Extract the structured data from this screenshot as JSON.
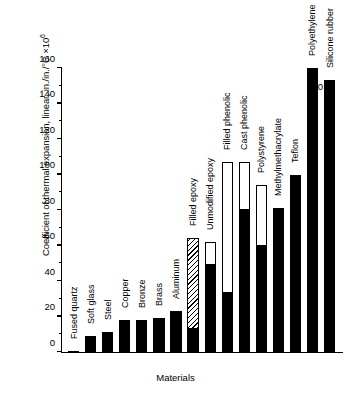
{
  "chart": {
    "type": "bar",
    "ylabel_prefix": "Coefficient of thermal expansion, linear, in./in./°C ×10",
    "ylabel_exponent": "6",
    "xlabel": "Materials"
  },
  "chart_data": {
    "type": "bar",
    "title": "",
    "xlabel": "Materials",
    "ylabel": "Coefficient of thermal expansion, linear, in./in./°C ×10⁶",
    "ylim": [
      0,
      160
    ],
    "yticks": [
      0,
      20,
      40,
      60,
      80,
      100,
      120,
      140,
      160
    ],
    "ytick_labels": [
      "0",
      "20",
      "40",
      "60",
      "80",
      "100",
      "120",
      "140",
      "160"
    ],
    "minor_tick_step": 10,
    "grid": false,
    "legend": null,
    "categories": [
      "Fused quartz",
      "Soft glass",
      "Steel",
      "Copper",
      "Bronze",
      "Brass",
      "Aluminum",
      "Filled epoxy",
      "Unmodified epoxy",
      "Filled phenolic",
      "Cast phenolic",
      "Polystyrene",
      "Methylmethacrylate",
      "Teflon",
      "Polyethylene",
      "Silicone rubber"
    ],
    "bars": [
      {
        "label": "Fused quartz",
        "solid_to": 0.6,
        "range_to": null,
        "style": "solid",
        "annotation": null
      },
      {
        "label": "Soft glass",
        "solid_to": 9,
        "range_to": null,
        "style": "solid",
        "annotation": null
      },
      {
        "label": "Steel",
        "solid_to": 11,
        "range_to": null,
        "style": "solid",
        "annotation": null
      },
      {
        "label": "Copper",
        "solid_to": 18,
        "range_to": null,
        "style": "solid",
        "annotation": null
      },
      {
        "label": "Bronze",
        "solid_to": 18,
        "range_to": null,
        "style": "solid",
        "annotation": null
      },
      {
        "label": "Brass",
        "solid_to": 19,
        "range_to": null,
        "style": "solid",
        "annotation": null
      },
      {
        "label": "Aluminum",
        "solid_to": 23,
        "range_to": null,
        "style": "solid",
        "annotation": null
      },
      {
        "label": "Filled epoxy",
        "solid_to": 13,
        "range_to": 64,
        "style": "hatch",
        "annotation": null
      },
      {
        "label": "Unmodified epoxy",
        "solid_to": 49,
        "range_to": 62,
        "style": "open",
        "annotation": null
      },
      {
        "label": "Filled phenolic",
        "solid_to": 33,
        "range_to": 107,
        "style": "open",
        "annotation": null
      },
      {
        "label": "Cast phenolic",
        "solid_to": 80,
        "range_to": 107,
        "style": "open",
        "annotation": null
      },
      {
        "label": "Polystyrene",
        "solid_to": 60,
        "range_to": 94,
        "style": "open",
        "annotation": null
      },
      {
        "label": "Methylmethacrylate",
        "solid_to": 81,
        "range_to": null,
        "style": "solid",
        "annotation": null
      },
      {
        "label": "Teflon",
        "solid_to": 100,
        "range_to": null,
        "style": "solid",
        "annotation": null
      },
      {
        "label": "Polyethylene",
        "solid_to": 160,
        "range_to": null,
        "style": "solid",
        "annotation": null
      },
      {
        "label": "Silicone rubber",
        "solid_to": 153,
        "range_to": null,
        "style": "solid",
        "annotation": "300"
      }
    ]
  }
}
